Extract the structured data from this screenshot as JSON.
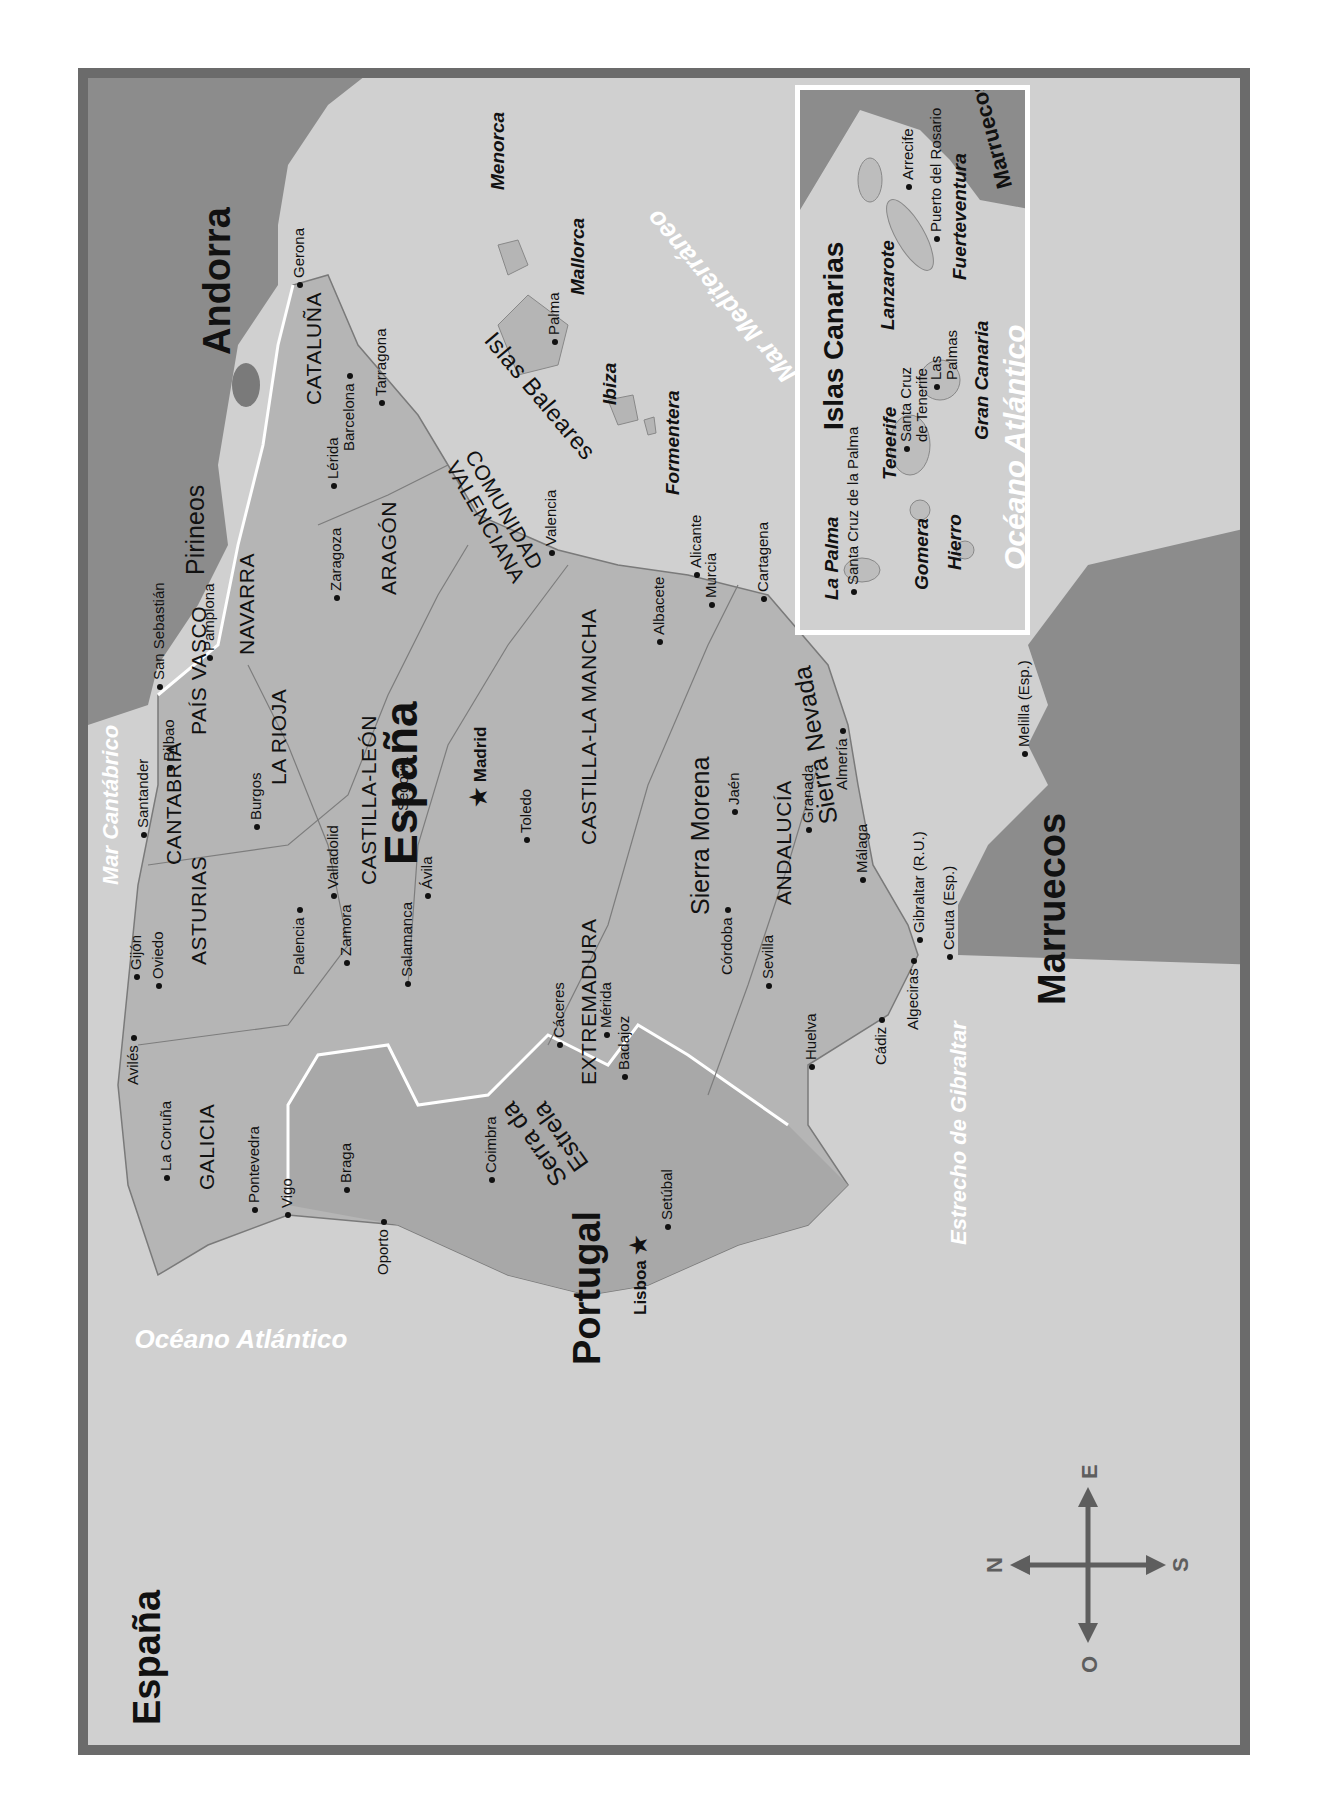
{
  "map": {
    "orientation_note": "rotated",
    "colors": {
      "sea": "#d0d0d0",
      "land_spain": "#b5b5b5",
      "land_portugal": "#a8a8a8",
      "foreign": "#8c8c8c",
      "frame": "#6b6b6b",
      "border_line": "#ffffff"
    },
    "countries": {
      "espana_main": "España",
      "espana_corner": "España",
      "portugal": "Portugal",
      "andorra": "Andorra",
      "marruecos": "Marruecos"
    },
    "capitals": [
      {
        "name": "Madrid",
        "icon": "star-icon"
      },
      {
        "name": "Lisboa",
        "icon": "star-icon"
      }
    ],
    "seas": {
      "cantabrico": "Mar Cantábrico",
      "mediterraneo": "Mar Mediterráneo",
      "atlantico": "Océano Atlántico",
      "estrecho": "Estrecho de Gibraltar"
    },
    "mountains": {
      "pirineos": "Pirineos",
      "sierra_morena": "Sierra Morena",
      "sierra_nevada": "Sierra Nevada",
      "serra_estrela_1": "Serra da",
      "serra_estrela_2": "Estrela"
    },
    "regions": {
      "galicia": "GALICIA",
      "asturias": "ASTURIAS",
      "cantabria": "CANTABRIA",
      "pais_vasco": "PAÍS VASCO",
      "navarra": "NAVARRA",
      "la_rioja": "LA RIOJA",
      "aragon": "ARAGÓN",
      "cataluna": "CATALUÑA",
      "castilla_leon": "CASTILLA-LEÓN",
      "castilla_mancha": "CASTILLA-LA MANCHA",
      "valenciana_1": "COMUNIDAD",
      "valenciana_2": "VALENCIANA",
      "extremadura": "EXTREMADURA",
      "andalucia": "ANDALUCÍA",
      "baleares": "Islas Baleares"
    },
    "islands": {
      "menorca": "Menorca",
      "mallorca": "Mallorca",
      "ibiza": "Ibiza",
      "formentera": "Formentera"
    },
    "cities": [
      {
        "name": "Gerona"
      },
      {
        "name": "Barcelona"
      },
      {
        "name": "Tarragona"
      },
      {
        "name": "Lérida"
      },
      {
        "name": "Zaragoza"
      },
      {
        "name": "Pamplona"
      },
      {
        "name": "San Sebastián"
      },
      {
        "name": "Bilbao"
      },
      {
        "name": "Santander"
      },
      {
        "name": "Burgos"
      },
      {
        "name": "Gijón"
      },
      {
        "name": "Oviedo"
      },
      {
        "name": "Avilés"
      },
      {
        "name": "Palencia"
      },
      {
        "name": "Valladolid"
      },
      {
        "name": "Zamora"
      },
      {
        "name": "Salamanca"
      },
      {
        "name": "Ávila"
      },
      {
        "name": "Segovia"
      },
      {
        "name": "Toledo"
      },
      {
        "name": "La Coruña"
      },
      {
        "name": "Pontevedra"
      },
      {
        "name": "Vigo"
      },
      {
        "name": "Braga"
      },
      {
        "name": "Oporto"
      },
      {
        "name": "Coimbra"
      },
      {
        "name": "Setúbal"
      },
      {
        "name": "Cáceres"
      },
      {
        "name": "Mérida"
      },
      {
        "name": "Badajoz"
      },
      {
        "name": "Córdoba"
      },
      {
        "name": "Sevilla"
      },
      {
        "name": "Huelva"
      },
      {
        "name": "Cádiz"
      },
      {
        "name": "Algeciras"
      },
      {
        "name": "Gibraltar (R.U.)"
      },
      {
        "name": "Ceuta (Esp.)"
      },
      {
        "name": "Málaga"
      },
      {
        "name": "Granada"
      },
      {
        "name": "Jaén"
      },
      {
        "name": "Almería"
      },
      {
        "name": "Melilla (Esp.)"
      },
      {
        "name": "Murcia"
      },
      {
        "name": "Cartagena"
      },
      {
        "name": "Alicante"
      },
      {
        "name": "Albacete"
      },
      {
        "name": "Valencia"
      },
      {
        "name": "Palma"
      }
    ],
    "canarias_inset": {
      "title": "Islas Canarias",
      "marruecos": "Marruecos",
      "ocean": "Océano Atlántico",
      "islands": [
        "La Palma",
        "Tenerife",
        "Gomera",
        "Hierro",
        "Gran Canaria",
        "Lanzarote",
        "Fuerteventura"
      ],
      "cities": [
        "Santa Cruz de la Palma",
        "Santa Cruz",
        "de Tenerife",
        "Las",
        "Palmas",
        "Arrecife",
        "Puerto del Rosario"
      ]
    },
    "compass": {
      "n": "N",
      "s": "S",
      "e": "E",
      "o": "O"
    }
  }
}
